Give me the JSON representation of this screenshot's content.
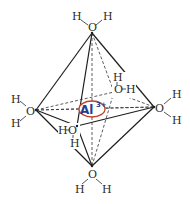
{
  "diagram": {
    "central_ion": {
      "symbol": "Al",
      "charge": "3+",
      "text_color": "#1f3f8f",
      "ellipse_color": "#c0402a"
    },
    "ligands": [
      {
        "id": "top",
        "o": "O",
        "h1": "H",
        "h2": "H"
      },
      {
        "id": "left",
        "o": "O",
        "h1": "H",
        "h2": "H"
      },
      {
        "id": "right",
        "o": "O",
        "h1": "H",
        "h2": "H"
      },
      {
        "id": "bottom",
        "o": "O",
        "h1": "H",
        "h2": "H"
      },
      {
        "id": "back",
        "o": "O",
        "h1": "H",
        "h2": "H"
      },
      {
        "id": "front",
        "o": "O",
        "h1": "H",
        "h2": "H"
      }
    ]
  }
}
